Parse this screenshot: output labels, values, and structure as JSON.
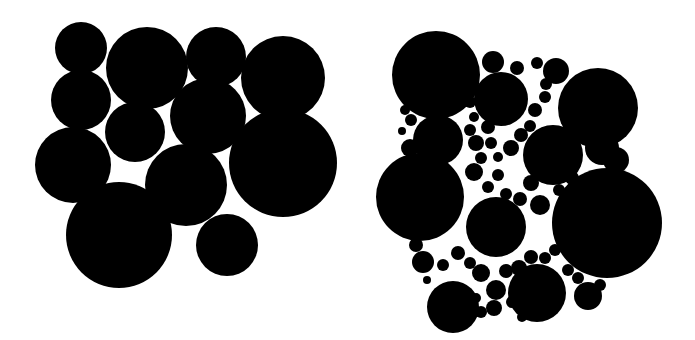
{
  "figure": {
    "background": "#ffffff",
    "fill": "#000000",
    "left_cluster": {
      "label": "",
      "circles": [
        [
          81,
          48,
          26
        ],
        [
          147,
          68,
          41
        ],
        [
          216,
          57,
          30
        ],
        [
          283,
          78,
          42
        ],
        [
          81,
          100,
          30
        ],
        [
          135,
          132,
          30
        ],
        [
          208,
          116,
          38
        ],
        [
          73,
          165,
          38
        ],
        [
          186,
          185,
          41
        ],
        [
          283,
          163,
          54
        ],
        [
          119,
          235,
          53
        ],
        [
          227,
          245,
          31
        ]
      ]
    },
    "right_cluster": {
      "label": "",
      "circles": [
        [
          436,
          75,
          44
        ],
        [
          493,
          62,
          11
        ],
        [
          517,
          68,
          7
        ],
        [
          537,
          63,
          6
        ],
        [
          556,
          71,
          13
        ],
        [
          501,
          99,
          27
        ],
        [
          598,
          108,
          40
        ],
        [
          438,
          140,
          25
        ],
        [
          553,
          155,
          30
        ],
        [
          602,
          148,
          17
        ],
        [
          616,
          160,
          13
        ],
        [
          420,
          197,
          44
        ],
        [
          496,
          227,
          30
        ],
        [
          607,
          223,
          55
        ],
        [
          453,
          307,
          26
        ],
        [
          537,
          293,
          29
        ],
        [
          588,
          296,
          14
        ],
        [
          405,
          110,
          5
        ],
        [
          411,
          120,
          6
        ],
        [
          402,
          131,
          4
        ],
        [
          410,
          148,
          9
        ],
        [
          420,
          165,
          6
        ],
        [
          470,
          102,
          6
        ],
        [
          474,
          117,
          5
        ],
        [
          470,
          130,
          6
        ],
        [
          476,
          143,
          8
        ],
        [
          481,
          158,
          6
        ],
        [
          488,
          127,
          7
        ],
        [
          491,
          143,
          6
        ],
        [
          498,
          157,
          5
        ],
        [
          511,
          148,
          8
        ],
        [
          521,
          135,
          7
        ],
        [
          530,
          126,
          6
        ],
        [
          535,
          110,
          7
        ],
        [
          545,
          97,
          6
        ],
        [
          546,
          84,
          6
        ],
        [
          540,
          139,
          5
        ],
        [
          474,
          172,
          9
        ],
        [
          488,
          187,
          6
        ],
        [
          498,
          175,
          6
        ],
        [
          506,
          194,
          6
        ],
        [
          520,
          199,
          7
        ],
        [
          531,
          183,
          8
        ],
        [
          540,
          205,
          10
        ],
        [
          559,
          190,
          6
        ],
        [
          572,
          178,
          7
        ],
        [
          575,
          195,
          6
        ],
        [
          458,
          253,
          7
        ],
        [
          470,
          263,
          6
        ],
        [
          481,
          273,
          9
        ],
        [
          496,
          290,
          10
        ],
        [
          506,
          271,
          7
        ],
        [
          519,
          268,
          8
        ],
        [
          531,
          257,
          7
        ],
        [
          545,
          258,
          6
        ],
        [
          555,
          250,
          6
        ],
        [
          416,
          245,
          7
        ],
        [
          423,
          262,
          11
        ],
        [
          427,
          280,
          4
        ],
        [
          443,
          265,
          6
        ],
        [
          476,
          298,
          5
        ],
        [
          481,
          312,
          6
        ],
        [
          494,
          308,
          8
        ],
        [
          512,
          302,
          6
        ],
        [
          522,
          317,
          5
        ],
        [
          568,
          270,
          6
        ],
        [
          578,
          278,
          6
        ],
        [
          600,
          285,
          6
        ]
      ]
    }
  }
}
